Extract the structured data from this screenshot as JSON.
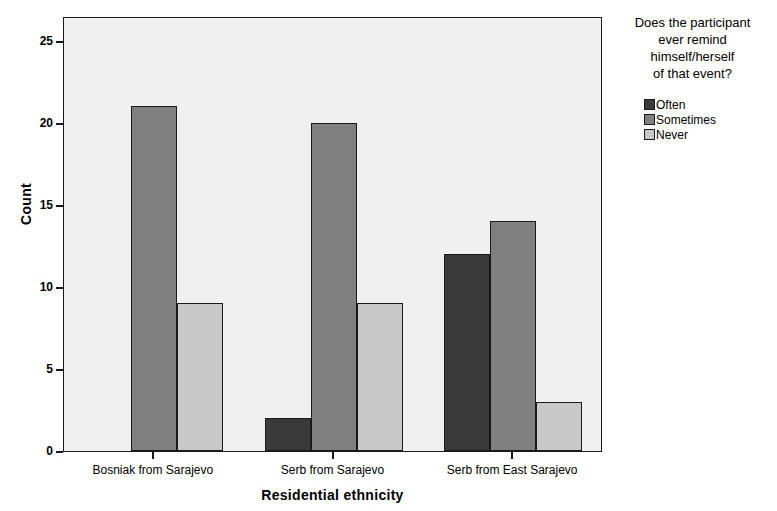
{
  "chart_data": {
    "type": "bar",
    "title": "",
    "subtitle": "",
    "xlabel": "Residential ethnicity",
    "ylabel": "Count",
    "categories": [
      "Bosniak from Sarajevo",
      "Serb from Sarajevo",
      "Serb from East Sarajevo"
    ],
    "series": [
      {
        "name": "Often",
        "values": [
          0,
          2,
          12
        ],
        "color": "#3a3a3a"
      },
      {
        "name": "Sometimes",
        "values": [
          21,
          20,
          14
        ],
        "color": "#808080"
      },
      {
        "name": "Never",
        "values": [
          9,
          9,
          3
        ],
        "color": "#c8c8c8"
      }
    ],
    "ylim": [
      0,
      26.5
    ],
    "yticks": [
      0,
      5,
      10,
      15,
      20,
      25
    ],
    "ytick_labels": [
      "0",
      "5",
      "10",
      "15",
      "20",
      "25"
    ],
    "grid": false,
    "legend_position": "right",
    "legend_title": "Does the participant\never remind\nhimself/herself\nof that event?",
    "plot_background": "#f0f0f0",
    "frame_color": "#1a1a1a",
    "bar_group_width_px": 140,
    "bar_width_px": 46
  },
  "axes": {
    "y_title": "Count",
    "x_title": "Residential ethnicity"
  },
  "legend": {
    "title": "Does the participant\never remind\nhimself/herself\nof that event?",
    "items": [
      {
        "label": "Often"
      },
      {
        "label": "Sometimes"
      },
      {
        "label": "Never"
      }
    ]
  }
}
